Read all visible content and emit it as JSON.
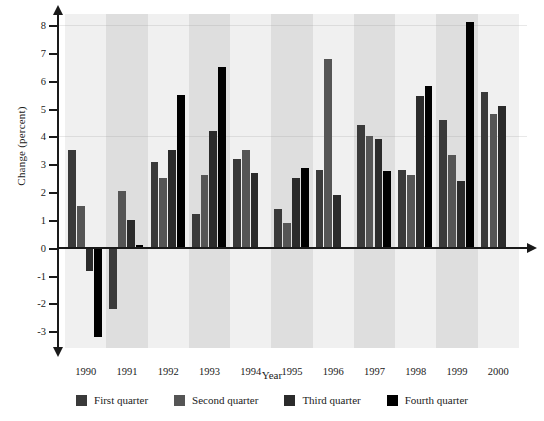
{
  "chart_data": {
    "type": "bar",
    "title": "",
    "xlabel": "Year",
    "ylabel": "Change (percent)",
    "categories": [
      "1990",
      "1991",
      "1992",
      "1993",
      "1994",
      "1995",
      "1996",
      "1997",
      "1998",
      "1999",
      "2000"
    ],
    "ylim": [
      -3.6,
      8.4
    ],
    "yticks": [
      8,
      7,
      6,
      5,
      4,
      3,
      2,
      1,
      0,
      -1,
      -2,
      -3
    ],
    "ytick_labels": [
      "8",
      "7",
      "6",
      "5",
      "4",
      "3",
      "2",
      "1",
      "0",
      "-1",
      "-2",
      "-3"
    ],
    "grid": false,
    "legend_position": "bottom",
    "series": [
      {
        "name": "First quarter",
        "color": "#3a3a3a",
        "values": [
          3.5,
          -2.2,
          3.1,
          1.2,
          3.2,
          1.4,
          2.8,
          4.4,
          2.8,
          4.6,
          5.6
        ]
      },
      {
        "name": "Second quarter",
        "color": "#555555",
        "values": [
          1.5,
          2.05,
          2.5,
          2.6,
          3.5,
          0.9,
          6.8,
          4.0,
          2.6,
          3.35,
          4.8
        ]
      },
      {
        "name": "Third quarter",
        "color": "#2b2b2b",
        "values": [
          -0.85,
          1.0,
          3.5,
          4.2,
          2.7,
          2.5,
          1.9,
          3.9,
          5.45,
          2.4,
          5.1
        ]
      },
      {
        "name": "Fourth quarter",
        "color": "#000000",
        "values": [
          -3.2,
          0.1,
          5.5,
          6.5,
          null,
          2.85,
          null,
          2.75,
          5.8,
          8.1,
          null
        ]
      }
    ],
    "bands": {
      "shaded_color": "#dedede",
      "plain_color": "#f0f0f0"
    }
  },
  "legend": {
    "items": [
      {
        "label": "First quarter",
        "color": "#3a3a3a"
      },
      {
        "label": "Second quarter",
        "color": "#555555"
      },
      {
        "label": "Third quarter",
        "color": "#2b2b2b"
      },
      {
        "label": "Fourth quarter",
        "color": "#000000"
      }
    ]
  }
}
